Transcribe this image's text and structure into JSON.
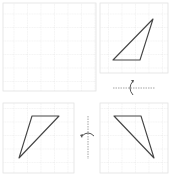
{
  "diagram": {
    "colors": {
      "grid": "#e2e2e2",
      "triangle_stroke": "#444444",
      "axis": "#9a9a9a",
      "arrow": "#555555",
      "background": "#ffffff"
    },
    "grid_spacing": 13.5,
    "panels": [
      {
        "id": "top-left",
        "x": 3,
        "y": 3,
        "w": 93,
        "h": 88,
        "empty": true
      },
      {
        "id": "top-right",
        "x": 100,
        "y": 3,
        "w": 68,
        "h": 70,
        "triangle": "113,60 140,60 153,19"
      },
      {
        "id": "bottom-left",
        "x": 3,
        "y": 103,
        "w": 71,
        "h": 70,
        "triangle": "32,116 59,116 19,158"
      },
      {
        "id": "bottom-right",
        "x": 100,
        "y": 103,
        "w": 68,
        "h": 70,
        "triangle": "114,116 141,116 154,158"
      }
    ],
    "flip_axes": [
      {
        "id": "horizontal-flip",
        "orientation": "horizontal",
        "x1": 113,
        "y1": 88,
        "x2": 155,
        "y2": 88
      },
      {
        "id": "vertical-flip",
        "orientation": "vertical",
        "x1": 88,
        "y1": 116,
        "x2": 88,
        "y2": 159
      }
    ]
  }
}
